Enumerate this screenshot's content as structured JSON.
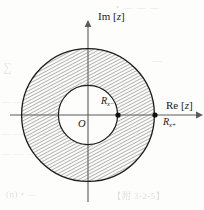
{
  "figure": {
    "kind": "complex-plane-roc-annulus",
    "background_color": "#fdfdfc",
    "stroke_color": "#1a1a1a",
    "hatch_color": "#3a3a3a"
  },
  "axes": {
    "imaginary": {
      "label_prefix": "Im [",
      "label_var": "z",
      "label_suffix": "]",
      "label_full": "Im [z]",
      "orientation": "vertical",
      "arrow": "up"
    },
    "real": {
      "label_prefix": "Re [",
      "label_var": "z",
      "label_suffix": "]",
      "label_full": "Re [z]",
      "orientation": "horizontal",
      "arrow": "right"
    },
    "origin_label": "O"
  },
  "geometry": {
    "center_x": 88,
    "center_y": 115,
    "inner_radius": 30,
    "outer_radius": 67,
    "hatch_angle_deg": 62,
    "hatch_spacing_px": 3
  },
  "markers": [
    {
      "name": "inner-radius-marker",
      "label_base": "R",
      "label_sub": "x−",
      "label_full": "Rx−",
      "x": 118,
      "y": 115
    },
    {
      "name": "outer-radius-marker",
      "label_base": "R",
      "label_sub": "x+",
      "label_full": "Rx+",
      "x": 155,
      "y": 115
    }
  ],
  "bleed_text": {
    "line1": "• — — —",
    "line2": "∑",
    "line3": "— — — — —",
    "line4": "— — — —",
    "line5": "— — — —",
    "line6": "(n) • —",
    "line7": "【附 3-2-5】",
    "line8": "—"
  }
}
